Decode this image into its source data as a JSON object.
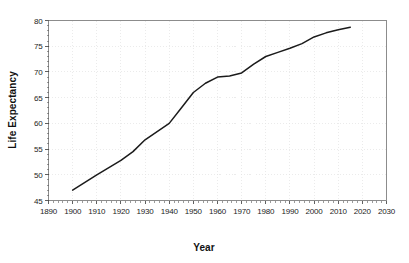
{
  "chart_data": {
    "type": "line",
    "title": "",
    "xlabel": "Year",
    "ylabel": "Life Expectancy",
    "xlim": [
      1890,
      2030
    ],
    "ylim": [
      45,
      80
    ],
    "grid": true,
    "legend": "none",
    "x_ticks": [
      1890,
      1900,
      1910,
      1920,
      1930,
      1940,
      1950,
      1960,
      1970,
      1980,
      1990,
      2000,
      2010,
      2020,
      2030
    ],
    "y_ticks": [
      45,
      50,
      55,
      60,
      65,
      70,
      75,
      80
    ],
    "x": [
      1900,
      1910,
      1920,
      1925,
      1930,
      1940,
      1945,
      1950,
      1955,
      1960,
      1965,
      1970,
      1975,
      1980,
      1985,
      1990,
      1995,
      2000,
      2005,
      2010,
      2015
    ],
    "values": [
      47.0,
      50.0,
      52.8,
      54.5,
      56.8,
      60.0,
      63.0,
      66.0,
      67.8,
      69.0,
      69.2,
      69.8,
      71.5,
      73.0,
      73.8,
      74.6,
      75.5,
      76.8,
      77.6,
      78.2,
      78.7
    ],
    "series": [
      {
        "name": "Life Expectancy",
        "color": "#1b1b1b",
        "values": [
          47.0,
          50.0,
          52.8,
          54.5,
          56.8,
          60.0,
          63.0,
          66.0,
          67.8,
          69.0,
          69.2,
          69.8,
          71.5,
          73.0,
          73.8,
          74.6,
          75.5,
          76.8,
          77.6,
          78.2,
          78.7
        ]
      }
    ]
  },
  "colors": {
    "background": "#ffffff",
    "line": "#1b1b1b",
    "frame": "#8c8c8c",
    "grid": "#e2e2e2",
    "text": "#1a1a1a"
  }
}
